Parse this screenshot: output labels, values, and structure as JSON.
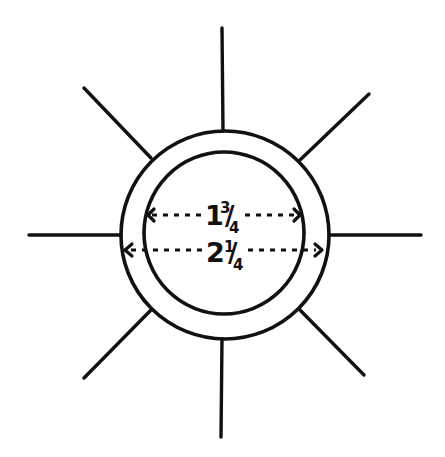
{
  "figure": {
    "spoke_count": 8,
    "stroke_color": "#111111",
    "background_color": "#ffffff"
  },
  "dimensions": [
    {
      "id": "inner-diameter",
      "whole": "1",
      "numerator": "3",
      "denominator": "4",
      "text": "1 3/4",
      "value": 1.75,
      "applies_to": "inner circle"
    },
    {
      "id": "outer-diameter",
      "whole": "2",
      "numerator": "1",
      "denominator": "4",
      "text": "2 1/4",
      "value": 2.25,
      "applies_to": "outer circle"
    }
  ]
}
